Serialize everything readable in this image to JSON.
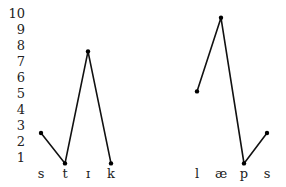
{
  "chart_data": {
    "type": "line",
    "title": "",
    "xlabel": "",
    "ylabel": "",
    "ylim": [
      0,
      10
    ],
    "yticks": [
      1,
      2,
      3,
      4,
      5,
      6,
      7,
      8,
      9,
      10
    ],
    "grid": false,
    "legend": null,
    "series": [
      {
        "name": "stɪk",
        "categories": [
          "s",
          "t",
          "ɪ",
          "k"
        ],
        "values": [
          2.5,
          0.6,
          7.6,
          0.6
        ]
      },
      {
        "name": "læps",
        "categories": [
          "l",
          "æ",
          "p",
          "s"
        ],
        "values": [
          5.1,
          9.7,
          0.6,
          2.5
        ]
      }
    ]
  },
  "axis": {
    "ticks": [
      "1",
      "2",
      "3",
      "4",
      "5",
      "6",
      "7",
      "8",
      "9",
      "10"
    ]
  },
  "words": [
    {
      "segments": [
        "s",
        "t",
        "ɪ",
        "k"
      ]
    },
    {
      "segments": [
        "l",
        "æ",
        "p",
        "s"
      ]
    }
  ]
}
